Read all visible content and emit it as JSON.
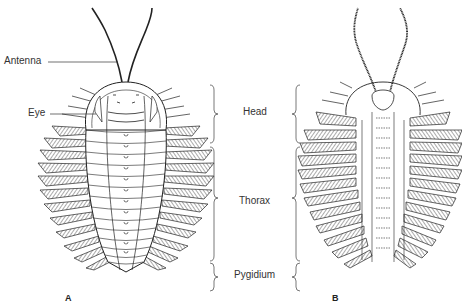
{
  "figure": {
    "panels": [
      {
        "id": "A",
        "letter": "A",
        "view": "dorsal"
      },
      {
        "id": "B",
        "letter": "B",
        "view": "ventral"
      }
    ],
    "left_labels": {
      "antenna": "Antenna",
      "eye": "Eye"
    },
    "region_labels": {
      "head": "Head",
      "thorax": "Thorax",
      "pygidium": "Pygidium"
    }
  }
}
